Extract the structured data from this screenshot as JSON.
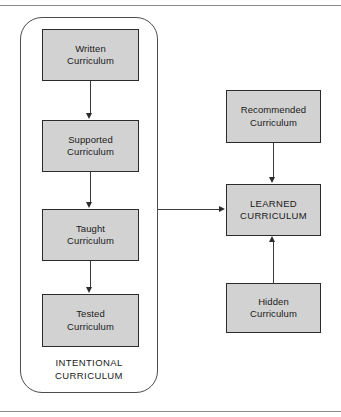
{
  "diagram": {
    "colors": {
      "node_fill": "#d2d2d2",
      "node_border": "#2b2b2b",
      "connector": "#3a3a3a",
      "frame_line": "#8c8c8c",
      "background": "#ffffff",
      "text": "#1a1a1a"
    },
    "group": {
      "caption": "INTENTIONAL\nCURRICULUM",
      "nodes": [
        {
          "id": "written",
          "label": "Written\nCurriculum"
        },
        {
          "id": "supported",
          "label": "Supported\nCurriculum"
        },
        {
          "id": "taught",
          "label": "Taught\nCurriculum"
        },
        {
          "id": "tested",
          "label": "Tested\nCurriculum"
        }
      ]
    },
    "outcome_nodes": [
      {
        "id": "recommended",
        "label": "Recommended\nCurriculum"
      },
      {
        "id": "learned",
        "label": "LEARNED\nCURRICULUM"
      },
      {
        "id": "hidden",
        "label": "Hidden\nCurriculum"
      }
    ],
    "connectors": [
      {
        "id": "written-supported",
        "from": "written",
        "to": "supported",
        "direction": "down"
      },
      {
        "id": "supported-taught",
        "from": "supported",
        "to": "taught",
        "direction": "down"
      },
      {
        "id": "taught-tested",
        "from": "taught",
        "to": "tested",
        "direction": "down"
      },
      {
        "id": "group-learned",
        "from": "intentional-curriculum-group",
        "to": "learned",
        "direction": "right"
      },
      {
        "id": "recommended-learned",
        "from": "recommended",
        "to": "learned",
        "direction": "down"
      },
      {
        "id": "hidden-learned",
        "from": "hidden",
        "to": "learned",
        "direction": "up"
      }
    ]
  }
}
